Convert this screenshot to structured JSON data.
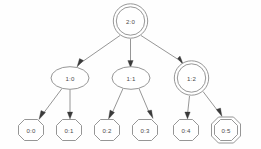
{
  "diagram": {
    "type": "directed-tree",
    "colors": {
      "background": "#fefefe",
      "node_stroke": "#8a8a8a",
      "node_fill": "#ffffff",
      "edge_stroke": "#8a8a8a",
      "arrow_fill": "#3a3a3a",
      "label_text": "#4a4a4a"
    },
    "levels": [
      {
        "index": 2,
        "nodes": [
          {
            "id": "n2_0",
            "label": "2:0",
            "shape": "doublecircle",
            "cx": 130,
            "cy": 21,
            "rx": 17.5,
            "ry": 17.5
          }
        ]
      },
      {
        "index": 1,
        "nodes": [
          {
            "id": "n1_0",
            "label": "1:0",
            "shape": "ellipse",
            "cx": 70,
            "cy": 78,
            "rx": 19,
            "ry": 11.5
          },
          {
            "id": "n1_1",
            "label": "1:1",
            "shape": "ellipse",
            "cx": 131,
            "cy": 78,
            "rx": 19,
            "ry": 11.5
          },
          {
            "id": "n1_2",
            "label": "1:2",
            "shape": "doublecircle",
            "cx": 192,
            "cy": 78,
            "rx": 17.5,
            "ry": 17.5
          }
        ]
      },
      {
        "index": 0,
        "nodes": [
          {
            "id": "n0_0",
            "label": "0:0",
            "shape": "octagon",
            "cx": 31,
            "cy": 130,
            "rx": 19,
            "ry": 11.5
          },
          {
            "id": "n0_1",
            "label": "0:1",
            "shape": "octagon",
            "cx": 69,
            "cy": 130,
            "rx": 19,
            "ry": 11.5
          },
          {
            "id": "n0_2",
            "label": "0:2",
            "shape": "octagon",
            "cx": 107,
            "cy": 130,
            "rx": 19,
            "ry": 11.5
          },
          {
            "id": "n0_3",
            "label": "0:3",
            "shape": "octagon",
            "cx": 145,
            "cy": 130,
            "rx": 19,
            "ry": 11.5
          },
          {
            "id": "n0_4",
            "label": "0:4",
            "shape": "octagon",
            "cx": 186,
            "cy": 130,
            "rx": 19,
            "ry": 11.5
          },
          {
            "id": "n0_5",
            "label": "0:5",
            "shape": "doubleoctagon",
            "cx": 226,
            "cy": 130,
            "rx": 20,
            "ry": 13
          }
        ]
      }
    ],
    "edges": [
      {
        "from": "2:0",
        "to": "1:0",
        "x1": 120,
        "y1": 35,
        "x2": 79,
        "y2": 64
      },
      {
        "from": "2:0",
        "to": "1:1",
        "x1": 130,
        "y1": 39,
        "x2": 130,
        "y2": 64
      },
      {
        "from": "2:0",
        "to": "1:2",
        "x1": 141,
        "y1": 35,
        "x2": 180,
        "y2": 62
      },
      {
        "from": "1:0",
        "to": "0:0",
        "x1": 62,
        "y1": 89,
        "x2": 41,
        "y2": 117
      },
      {
        "from": "1:0",
        "to": "0:1",
        "x1": 70,
        "y1": 90,
        "x2": 70,
        "y2": 117
      },
      {
        "from": "1:1",
        "to": "0:2",
        "x1": 123,
        "y1": 89,
        "x2": 113,
        "y2": 117
      },
      {
        "from": "1:1",
        "to": "0:3",
        "x1": 139,
        "y1": 89,
        "x2": 150,
        "y2": 117
      },
      {
        "from": "1:2",
        "to": "0:4",
        "x1": 190,
        "y1": 96,
        "x2": 187,
        "y2": 116
      },
      {
        "from": "1:2",
        "to": "0:5",
        "x1": 203,
        "y1": 92,
        "x2": 219,
        "y2": 115
      }
    ]
  }
}
